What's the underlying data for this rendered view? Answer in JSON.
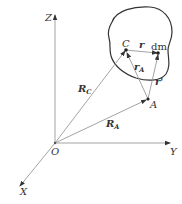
{
  "diagram": {
    "type": "rigid-body-vector-diagram",
    "axes": {
      "origin_label": "O",
      "x_label": "X",
      "y_label": "Y",
      "z_label": "Z"
    },
    "points": {
      "center_of_mass": "C",
      "mass_element": "dm",
      "reference_point": "A"
    },
    "vectors": {
      "R_C": {
        "symbol": "R",
        "subscript": "C"
      },
      "R_A": {
        "symbol": "R",
        "subscript": "A"
      },
      "r_A": {
        "symbol": "r",
        "subscript": "A"
      },
      "r": {
        "symbol": "r"
      },
      "r_prime": {
        "symbol": "r'"
      }
    },
    "colors": {
      "line": "#999999",
      "outline": "#333333",
      "text": "#333333"
    }
  }
}
